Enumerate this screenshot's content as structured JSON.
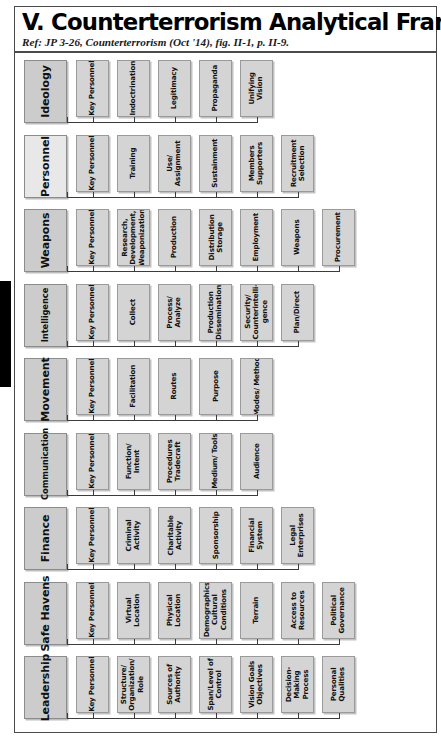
{
  "header": {
    "title": "V. Counterterrorism Analytical Framework",
    "subtitle": "Ref: JP 3-26, Counterterrorism (Oct '14), fig. II-1, p. II-9."
  },
  "colors": {
    "category_fill": "#cccccc",
    "category_fill_alt": "#e8e8e8",
    "node_fill": "#d4d4d4",
    "border": "#8c8c8c",
    "connector": "#3b3b3b",
    "page_border": "#4a4a4a",
    "tab": "#000000"
  },
  "chart_data": {
    "type": "diagram",
    "title": "V. Counterterrorism Analytical Framework",
    "subtitle": "Ref: JP 3-26, Counterterrorism (Oct '14), fig. II-1, p. II-9.",
    "orientation": "rotated-90",
    "categories": [
      {
        "label": "Ideology",
        "nodes": [
          "Key Personnel",
          "Indoctrination",
          "Legitimacy",
          "Propaganda",
          "Unifying Vision"
        ]
      },
      {
        "label": "Personnel",
        "nodes": [
          "Key Personnel",
          "Training",
          "Use/ Assignment",
          "Sustainment",
          "Members Supporters",
          "Recruitment Selection"
        ]
      },
      {
        "label": "Weapons",
        "nodes": [
          "Key Personnel",
          "Research, Development, Weaponization",
          "Production",
          "Distribution Storage",
          "Employment",
          "Weapons",
          "Procurement"
        ]
      },
      {
        "label": "Intelligence",
        "nodes": [
          "Key Personnel",
          "Collect",
          "Process/ Analyze",
          "Production Dissemination",
          "Security/ Counterintelli- gence",
          "Plan/Direct"
        ]
      },
      {
        "label": "Movement",
        "nodes": [
          "Key Personnel",
          "Facilitation",
          "Routes",
          "Purpose",
          "Modes/ Method"
        ]
      },
      {
        "label": "Communication",
        "nodes": [
          "Key Personnel",
          "Function/ Intent",
          "Procedures Tradecraft",
          "Medium/ Tools",
          "Audience"
        ]
      },
      {
        "label": "Finance",
        "nodes": [
          "Key Personnel",
          "Criminal Activity",
          "Charitable Activity",
          "Sponsorship",
          "Financial System",
          "Legal Enterprises"
        ]
      },
      {
        "label": "Safe Havens",
        "nodes": [
          "Key Personnel",
          "Virtual Location",
          "Physical Location",
          "Demographics Cultural Conditions",
          "Terrain",
          "Access to Resources",
          "Political Governance"
        ]
      },
      {
        "label": "Leadership",
        "nodes": [
          "Key Personnel",
          "Structure/ Organization/ Role",
          "Sources of Authority",
          "Span/Level of Control",
          "Vision Goals Objectives",
          "Decision- Making Process",
          "Personal Qualities"
        ]
      }
    ]
  }
}
